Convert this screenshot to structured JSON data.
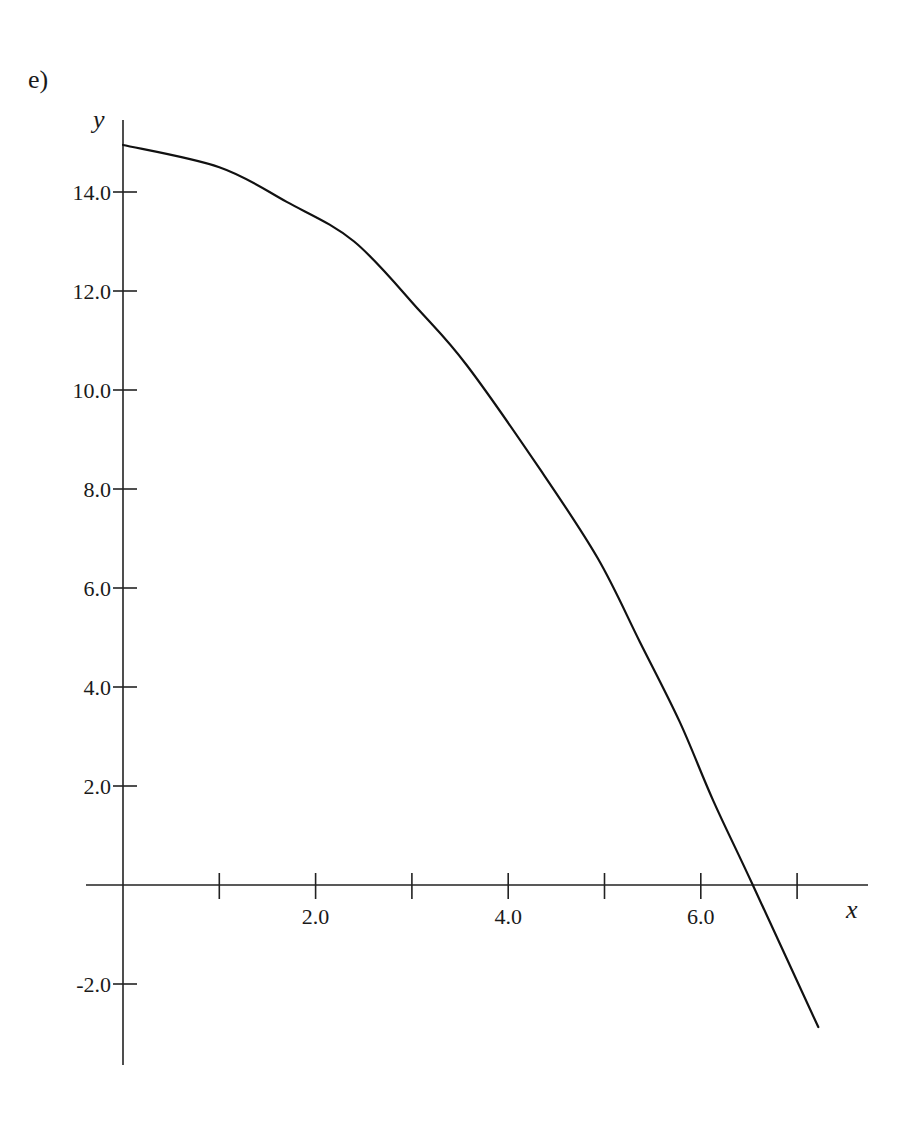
{
  "panel_label": "e)",
  "chart_data": {
    "type": "line",
    "title": "",
    "xlabel": "x",
    "ylabel": "y",
    "xlim": [
      -0.4,
      7.7
    ],
    "ylim": [
      -3.6,
      15.6
    ],
    "grid": false,
    "legend": null,
    "x_ticks": [
      1,
      2,
      3,
      4,
      5,
      6,
      7
    ],
    "x_tick_labels": [
      {
        "value": 2,
        "label": "2.0"
      },
      {
        "value": 4,
        "label": "4.0"
      },
      {
        "value": 6,
        "label": "6.0"
      }
    ],
    "y_ticks": [
      -2,
      2,
      4,
      6,
      8,
      10,
      12,
      14
    ],
    "y_tick_labels": [
      {
        "value": 14,
        "label": "14.0"
      },
      {
        "value": 12,
        "label": "12.0"
      },
      {
        "value": 10,
        "label": "10.0"
      },
      {
        "value": 8,
        "label": "8.0"
      },
      {
        "value": 6,
        "label": "6.0"
      },
      {
        "value": 4,
        "label": "4.0"
      },
      {
        "value": 2,
        "label": "2.0"
      },
      {
        "value": -2,
        "label": "-2.0"
      }
    ],
    "series": [
      {
        "name": "y(x)",
        "x": [
          0.0,
          1.0,
          1.7,
          2.4,
          3.08,
          3.57,
          4.33,
          4.93,
          5.37,
          5.78,
          6.13,
          6.54,
          7.22
        ],
        "y": [
          14.95,
          14.5,
          13.8,
          13.0,
          11.6,
          10.5,
          8.4,
          6.6,
          4.9,
          3.3,
          1.7,
          0.0,
          -2.87
        ]
      }
    ],
    "annotations": [
      "x-intercept near x ≈ 6.5"
    ]
  },
  "layout": {
    "origin_px": [
      123,
      885
    ],
    "px_per_x": 96.3,
    "px_per_y": 49.5,
    "x_axis_px": [
      86,
      868
    ],
    "y_axis_px": [
      120,
      1065
    ]
  }
}
